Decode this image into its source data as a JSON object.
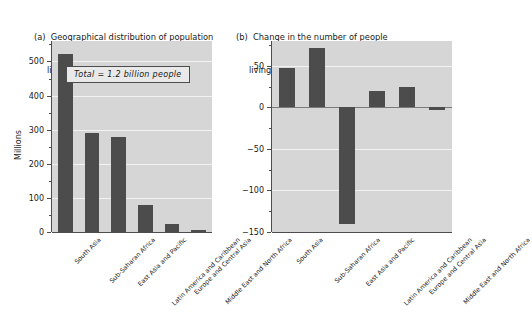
{
  "figure": {
    "background_color": "#ffffff",
    "plot_background_color": "#d6d6d6",
    "bar_color": "#4c4c4c",
    "gridline_color": "#f2f2f2",
    "axis_color": "#4d4d4d"
  },
  "chart_data": [
    {
      "type": "bar",
      "panel_letter": "(a)",
      "title": "Geographical distribution of population living on less than $1 per day, 1998",
      "title_line1": "(a)  Geographical distribution of population",
      "title_line2": "living on less than $1 per day, 1998",
      "categories": [
        "South Asia",
        "Sub-Saharan Africa",
        "East Asia and Pacific",
        "Latin America and Caribbean",
        "Europe and Central Asia",
        "Middle East and North Africa"
      ],
      "values": [
        522,
        291,
        278,
        78,
        24,
        6
      ],
      "xlabel": "",
      "ylabel": "Millions",
      "ylim": [
        0,
        560
      ],
      "yticks": [
        0,
        100,
        200,
        300,
        400,
        500
      ],
      "ytick_labels": [
        "0",
        "100",
        "200",
        "300",
        "400",
        "500"
      ],
      "minor_tick_interval": 50,
      "grid": true,
      "legend": "none",
      "annotation": "Total  =  1.2 billion people"
    },
    {
      "type": "bar",
      "panel_letter": "(b)",
      "title": "Change in the number of people living on less than $1 per day, 1987-98",
      "title_line1": "(b)  Change in the number of people",
      "title_line2": "living on less than $1 per day, 1987–98",
      "categories": [
        "South Asia",
        "Sub-Saharan Africa",
        "East Asia and Pacific",
        "Latin America and Caribbean",
        "Europe and Central Asia",
        "Middle East and North Africa"
      ],
      "values": [
        47,
        71,
        -140,
        20,
        25,
        -3
      ],
      "xlabel": "",
      "ylabel": "",
      "ylim": [
        -150,
        80
      ],
      "yticks": [
        -150,
        -100,
        -50,
        0,
        50
      ],
      "ytick_labels": [
        "−150",
        "−100",
        "−50",
        "0",
        "50"
      ],
      "minor_tick_interval": 25,
      "grid": true,
      "legend": "none"
    }
  ]
}
